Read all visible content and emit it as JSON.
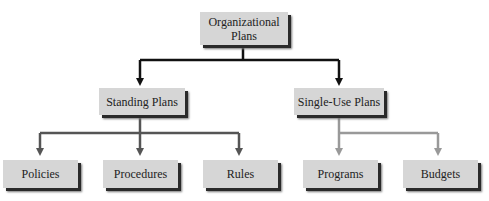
{
  "diagram": {
    "root": {
      "label_line1": "Organizational",
      "label_line2": "Plans"
    },
    "level2": [
      {
        "label": "Standing Plans"
      },
      {
        "label": "Single-Use Plans"
      }
    ],
    "level3": [
      {
        "label": "Policies",
        "parent": "Standing Plans"
      },
      {
        "label": "Procedures",
        "parent": "Standing Plans"
      },
      {
        "label": "Rules",
        "parent": "Standing Plans"
      },
      {
        "label": "Programs",
        "parent": "Single-Use Plans"
      },
      {
        "label": "Budgets",
        "parent": "Single-Use Plans"
      }
    ],
    "colors": {
      "box_fill": "#d6d6d6",
      "box_shadow": "#2a2a2a",
      "root_connector": "#111111",
      "standing_connector": "#555555",
      "single_use_connector": "#999999"
    }
  }
}
